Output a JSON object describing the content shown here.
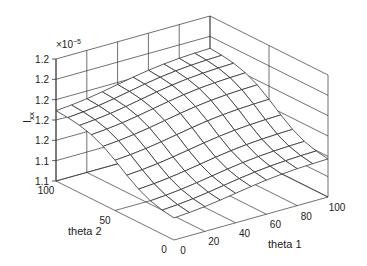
{
  "chart_data": {
    "type": "surface",
    "title": "",
    "xlabel": "theta 1",
    "ylabel": "theta 2",
    "zlabel": "I_xx",
    "zlabel_main": "I",
    "zlabel_sub": "xx",
    "z_exponent_label": "×10",
    "z_exponent_power": "−5",
    "x_ticks": [
      "0",
      "20",
      "40",
      "60",
      "80",
      "100"
    ],
    "x_tick_values": [
      0,
      20,
      40,
      60,
      80,
      100
    ],
    "y_ticks": [
      "0",
      "50",
      "100"
    ],
    "y_tick_values": [
      0,
      50,
      100
    ],
    "z_ticks": [
      "1.1",
      "1.1",
      "1.2",
      "1.2",
      "1.2",
      "1.2",
      "1.2"
    ],
    "xlim": [
      0,
      100
    ],
    "ylim": [
      0,
      100
    ],
    "zlim": [
      0,
      6
    ],
    "grid": true,
    "mesh_x": [
      0,
      10,
      20,
      30,
      40,
      50,
      60,
      70,
      80,
      90,
      100
    ],
    "mesh_y": [
      0,
      10,
      20,
      30,
      40,
      50,
      60,
      70,
      80,
      90,
      100
    ],
    "surface_description": "Smooth sigmoid-like ridge; minimum near theta1=0,theta2=0 front corner, maximum near theta1=100,theta2=100 back corner",
    "colors": {
      "line": "#333333",
      "surface": "#ffffff",
      "axis": "#333333"
    }
  },
  "projection": {
    "origin_bottom": [
      174,
      240
    ],
    "x_end_bottom": [
      328,
      197
    ],
    "y_end_bottom": [
      56,
      181
    ],
    "z_height": 122
  }
}
